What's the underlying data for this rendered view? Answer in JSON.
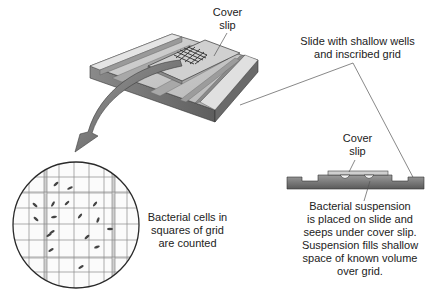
{
  "diagram": {
    "type": "scientific-illustration",
    "colors": {
      "background": "#ffffff",
      "text": "#222222",
      "slide_top": "#c8c8c8",
      "slide_side": "#7a7a7a",
      "arrow": "#6e6e6e",
      "grid_line": "#8a8a8a",
      "cell": "#444444",
      "leader_line": "#555555"
    }
  },
  "labels": {
    "cover_slip_top": {
      "lines": [
        "Cover",
        "slip"
      ]
    },
    "slide_description": {
      "lines": [
        "Slide with shallow wells",
        "and inscribed grid"
      ]
    },
    "cover_slip_section": {
      "lines": [
        "Cover",
        "slip"
      ]
    },
    "suspension_description": {
      "lines": [
        "Bacterial suspension",
        "is placed on slide and",
        "seeps under cover slip.",
        "Suspension fills shallow",
        "space of known volume",
        "over grid."
      ]
    },
    "cells_counted": {
      "lines": [
        "Bacterial cells in",
        "squares of grid",
        "are counted"
      ]
    }
  },
  "components": {
    "slide_3d": {
      "name": "counting-chamber-slide",
      "has_cover_slip": true,
      "has_grid": true
    },
    "magnified_view": {
      "name": "magnified-grid-circle",
      "grid_columns": 11,
      "grid_rows": 11,
      "visible_cell_count": 17
    },
    "cross_section": {
      "name": "slide-cross-section",
      "shows_bubbles": 2
    },
    "arrow": {
      "name": "magnify-arrow",
      "direction": "from slide grid down-left to magnified view"
    }
  }
}
